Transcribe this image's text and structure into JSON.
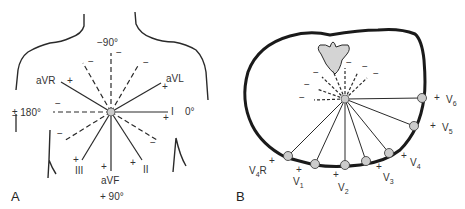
{
  "panels": {
    "A": {
      "label": "A",
      "title_top": "−90°",
      "title_bottom": "+ 90°",
      "left_angle": "± 180°",
      "right_angle": "0°",
      "leads": [
        {
          "name": "aVR",
          "label": "aVR",
          "angle": -150,
          "positive": "+"
        },
        {
          "name": "aVL",
          "label": "aVL",
          "angle": -30,
          "positive": "+"
        },
        {
          "name": "I",
          "label": "I",
          "angle": 0,
          "positive": "+"
        },
        {
          "name": "II",
          "label": "II",
          "angle": 60,
          "positive": "+"
        },
        {
          "name": "aVF",
          "label": "aVF",
          "angle": 90,
          "positive": "+"
        },
        {
          "name": "III",
          "label": "III",
          "angle": 120,
          "positive": "+"
        }
      ],
      "negative_sign": "−",
      "positive_sign": "+"
    },
    "B": {
      "label": "B",
      "leads": [
        {
          "name": "V4R",
          "main": "V",
          "sub": "4",
          "suffix": "R",
          "positive": "+"
        },
        {
          "name": "V1",
          "main": "V",
          "sub": "1",
          "suffix": "",
          "positive": "+"
        },
        {
          "name": "V2",
          "main": "V",
          "sub": "2",
          "suffix": "",
          "positive": "+"
        },
        {
          "name": "V3",
          "main": "V",
          "sub": "3",
          "suffix": "",
          "positive": "+"
        },
        {
          "name": "V4",
          "main": "V",
          "sub": "4",
          "suffix": "",
          "positive": "+"
        },
        {
          "name": "V5",
          "main": "V",
          "sub": "5",
          "suffix": "",
          "positive": "+"
        },
        {
          "name": "V6",
          "main": "V",
          "sub": "6",
          "suffix": "",
          "positive": "+"
        }
      ],
      "negative_sign": "−",
      "positive_sign": "+"
    }
  },
  "colors": {
    "line": "#2a2a2a",
    "electrode_fill": "#cccccc",
    "vertebra_fill": "#d4d4d4"
  }
}
